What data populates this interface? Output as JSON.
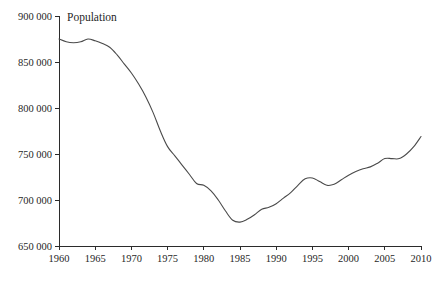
{
  "chart_data": {
    "type": "line",
    "title": "",
    "annotation": "Population",
    "xlabel": "",
    "ylabel": "",
    "xlim": [
      1960,
      2010
    ],
    "ylim": [
      650000,
      900000
    ],
    "grid": false,
    "legend_position": "none",
    "x_tick_labels": [
      "1960",
      "1965",
      "1970",
      "1975",
      "1980",
      "1985",
      "1990",
      "1995",
      "2000",
      "2005",
      "2010"
    ],
    "x_tick_values": [
      1960,
      1965,
      1970,
      1975,
      1980,
      1985,
      1990,
      1995,
      2000,
      2005,
      2010
    ],
    "y_tick_labels": [
      "900 000",
      "850 000",
      "800 000",
      "750 000",
      "700 000",
      "650 000"
    ],
    "y_tick_values": [
      900000,
      850000,
      800000,
      750000,
      700000,
      650000
    ],
    "line_color": "#4a4a4a",
    "axis_color": "#2b2b2b",
    "background_color": "#ffffff",
    "series": [
      {
        "name": "Population",
        "x": [
          1960,
          1961,
          1962,
          1963,
          1964,
          1965,
          1966,
          1967,
          1968,
          1969,
          1970,
          1971,
          1972,
          1973,
          1974,
          1975,
          1976,
          1977,
          1978,
          1979,
          1980,
          1981,
          1982,
          1983,
          1984,
          1985,
          1986,
          1987,
          1988,
          1989,
          1990,
          1991,
          1992,
          1993,
          1994,
          1995,
          1996,
          1997,
          1998,
          1999,
          2000,
          2001,
          2002,
          2003,
          2004,
          2005,
          2006,
          2007,
          2008,
          2009,
          2010
        ],
        "values": [
          875000,
          872000,
          871000,
          872000,
          875000,
          873000,
          870000,
          866000,
          858000,
          848000,
          838000,
          826000,
          812000,
          795000,
          775000,
          758000,
          748000,
          738000,
          728000,
          718000,
          716000,
          710000,
          700000,
          688000,
          678000,
          676000,
          679000,
          684000,
          690000,
          692000,
          696000,
          702000,
          708000,
          716000,
          723000,
          724000,
          720000,
          716000,
          717000,
          722000,
          727000,
          731000,
          734000,
          736000,
          740000,
          745000,
          745000,
          745000,
          750000,
          758000,
          769000
        ]
      }
    ]
  }
}
